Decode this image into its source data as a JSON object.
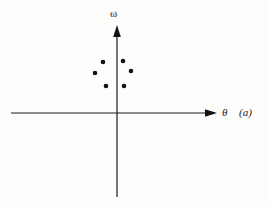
{
  "figure": {
    "caption_label": "(a)",
    "background_color": "#fdfdfc",
    "ink_color": "#1a1a1a"
  },
  "chart_data": {
    "type": "scatter",
    "title": "",
    "subtitle": "",
    "xlabel": "θ",
    "ylabel": "ω",
    "annotations": [
      "(a)"
    ],
    "grid": false,
    "legend": null,
    "axes": {
      "style": "arrowed-cross",
      "origin": [
        117,
        113
      ],
      "x_axis": {
        "label": "θ",
        "from": [
          11,
          113
        ],
        "to": [
          217,
          113
        ],
        "arrow": "right",
        "ticks": [],
        "ticklabels": []
      },
      "y_axis": {
        "label": "ω",
        "from": [
          117,
          197
        ],
        "to": [
          117,
          25
        ],
        "arrow": "up",
        "ticks": [],
        "ticklabels": []
      }
    },
    "marker": {
      "shape": "filled-circle",
      "radius_px": 2.3,
      "color": "#121212"
    },
    "points_px": [
      [
        103,
        62
      ],
      [
        123,
        61
      ],
      [
        95,
        73
      ],
      [
        131,
        71
      ],
      [
        106,
        86
      ],
      [
        124,
        86
      ]
    ],
    "points": [
      [
        -0.14,
        0.51
      ],
      [
        0.06,
        0.52
      ],
      [
        -0.22,
        0.4
      ],
      [
        0.14,
        0.42
      ],
      [
        -0.11,
        0.27
      ],
      [
        0.07,
        0.27
      ]
    ],
    "n_points": 6
  }
}
